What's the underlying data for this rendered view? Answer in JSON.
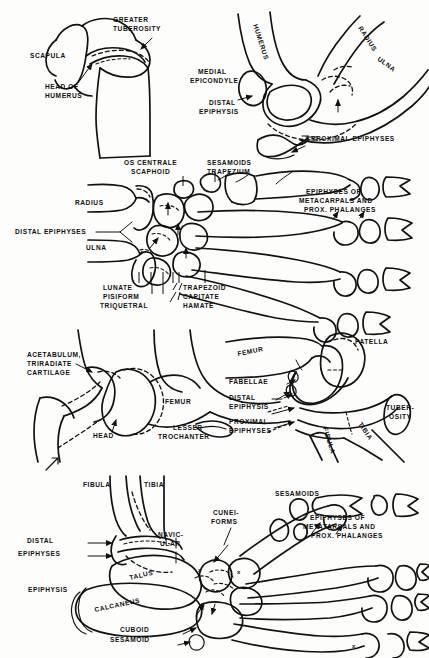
{
  "figure": {
    "page_mark": "71",
    "ink_color": "#111111",
    "background_color": "#fdfdfc",
    "panel_count": 4
  },
  "panels": [
    {
      "id": "shoulder-elbow",
      "name": "Shoulder and elbow",
      "labels": [
        {
          "id": "greater-tuberosity",
          "lines": [
            "GREATER",
            "TUBEROSITY"
          ],
          "x": 113,
          "y": 22,
          "anchor": "start"
        },
        {
          "id": "scapula",
          "lines": [
            "SCAPULA"
          ],
          "x": 30,
          "y": 56,
          "anchor": "start"
        },
        {
          "id": "head-of-humerus",
          "lines": [
            "HEAD OF",
            "HUMERUS"
          ],
          "x": 45,
          "y": 87,
          "anchor": "start"
        },
        {
          "id": "humerus-elbow",
          "lines": [
            "HUMERUS"
          ],
          "x": 253,
          "y": 25,
          "anchor": "start",
          "rotate": 72
        },
        {
          "id": "radius",
          "lines": [
            "RADIUS"
          ],
          "x": 358,
          "y": 28,
          "anchor": "start",
          "rotate": 57
        },
        {
          "id": "ulna",
          "lines": [
            "ULNA"
          ],
          "x": 377,
          "y": 60,
          "anchor": "start",
          "rotate": 36
        },
        {
          "id": "medial-epicondyle",
          "lines": [
            "MEDIAL",
            "EPICONDYLE"
          ],
          "x": 198,
          "y": 72,
          "anchor": "start"
        },
        {
          "id": "distal-epiphysis",
          "lines": [
            "DISTAL",
            "EPIPHYSIS"
          ],
          "x": 206,
          "y": 103,
          "anchor": "start"
        },
        {
          "id": "proximal-epiphyses",
          "lines": [
            "PROXIMAL EPIPHYSES"
          ],
          "x": 311,
          "y": 139,
          "anchor": "start"
        }
      ]
    },
    {
      "id": "hand-wrist",
      "name": "Hand and wrist",
      "labels": [
        {
          "id": "os-centrale",
          "lines": [
            "OS CENTRALE"
          ],
          "x": 124,
          "y": 163,
          "anchor": "start"
        },
        {
          "id": "scaphoid",
          "lines": [
            "SCAPHOID"
          ],
          "x": 131,
          "y": 172,
          "anchor": "start"
        },
        {
          "id": "sesamoids",
          "lines": [
            "SESAMOIDS"
          ],
          "x": 207,
          "y": 163,
          "anchor": "start"
        },
        {
          "id": "trapezium",
          "lines": [
            "TRAPEZIUM"
          ],
          "x": 207,
          "y": 172,
          "anchor": "start"
        },
        {
          "id": "radius-hand",
          "lines": [
            "RADIUS"
          ],
          "x": 75,
          "y": 203,
          "anchor": "start"
        },
        {
          "id": "ulna-hand",
          "lines": [
            "ULNA"
          ],
          "x": 86,
          "y": 248,
          "anchor": "start"
        },
        {
          "id": "distal-epiphyses-hand",
          "lines": [
            "DISTAL EPIPHYSES"
          ],
          "x": 15,
          "y": 230,
          "anchor": "start"
        },
        {
          "id": "epiphyses-metacarpals",
          "lines": [
            "EPIPHYSES OF",
            "METACARPALS AND",
            "PROX. PHALANGES"
          ],
          "x": 303,
          "y": 192,
          "anchor": "start"
        },
        {
          "id": "lunate",
          "lines": [
            "LUNATE"
          ],
          "x": 103,
          "y": 288,
          "anchor": "start"
        },
        {
          "id": "pisiform",
          "lines": [
            "PISIFORM"
          ],
          "x": 103,
          "y": 297,
          "anchor": "start"
        },
        {
          "id": "triquetral",
          "lines": [
            "TRIQUETRAL"
          ],
          "x": 103,
          "y": 306,
          "anchor": "start"
        },
        {
          "id": "trapezoid",
          "lines": [
            "TRAPEZOID"
          ],
          "x": 181,
          "y": 288,
          "anchor": "start"
        },
        {
          "id": "capitate",
          "lines": [
            "CAPITATE"
          ],
          "x": 181,
          "y": 297,
          "anchor": "start"
        },
        {
          "id": "hamate",
          "lines": [
            "HAMATE"
          ],
          "x": 181,
          "y": 306,
          "anchor": "start"
        }
      ]
    },
    {
      "id": "hip-knee",
      "name": "Hip and knee",
      "labels": [
        {
          "id": "acetabulum",
          "lines": [
            "ACETABULUM,",
            "TRIRADIATE",
            "CARTILAGE"
          ],
          "x": 27,
          "y": 355,
          "anchor": "start"
        },
        {
          "id": "femur-hip",
          "lines": [
            "FEMUR"
          ],
          "x": 165,
          "y": 402,
          "anchor": "start"
        },
        {
          "id": "head",
          "lines": [
            "HEAD"
          ],
          "x": 93,
          "y": 436,
          "anchor": "start"
        },
        {
          "id": "lesser-trochanter",
          "lines": [
            "LESSER",
            "TROCHANTER"
          ],
          "x": 160,
          "y": 428,
          "anchor": "start"
        },
        {
          "id": "patella",
          "lines": [
            "PATELLA"
          ],
          "x": 355,
          "y": 342,
          "anchor": "start"
        },
        {
          "id": "femur-knee",
          "lines": [
            "FEMUR"
          ],
          "x": 238,
          "y": 354,
          "anchor": "start",
          "rotate": -12
        },
        {
          "id": "fabellae",
          "lines": [
            "FABELLAE"
          ],
          "x": 229,
          "y": 382,
          "anchor": "start"
        },
        {
          "id": "distal-epiphysis-knee",
          "lines": [
            "DISTAL",
            "EPIPHYSIS"
          ],
          "x": 229,
          "y": 398,
          "anchor": "start"
        },
        {
          "id": "proximal-epiphyses-knee",
          "lines": [
            "PROXIMAL",
            "EPIPHYSES"
          ],
          "x": 229,
          "y": 422,
          "anchor": "start"
        },
        {
          "id": "tuberosity",
          "lines": [
            "TUBER-",
            "OSITY"
          ],
          "x": 385,
          "y": 408,
          "anchor": "start"
        },
        {
          "id": "fibula-knee",
          "lines": [
            "FIBULA"
          ],
          "x": 323,
          "y": 428,
          "anchor": "start",
          "rotate": 73
        },
        {
          "id": "tibia-knee",
          "lines": [
            "TIBIA"
          ],
          "x": 358,
          "y": 424,
          "anchor": "start",
          "rotate": 57
        }
      ]
    },
    {
      "id": "foot-ankle",
      "name": "Foot and ankle",
      "labels": [
        {
          "id": "fibula-foot",
          "lines": [
            "FIBULA"
          ],
          "x": 83,
          "y": 485,
          "anchor": "start"
        },
        {
          "id": "tibia-foot",
          "lines": [
            "TIBIA"
          ],
          "x": 144,
          "y": 485,
          "anchor": "start"
        },
        {
          "id": "sesamoids-foot",
          "lines": [
            "SESAMOIDS"
          ],
          "x": 275,
          "y": 494,
          "anchor": "start"
        },
        {
          "id": "cuneiforms",
          "lines": [
            "CUNEI-",
            "FORMS"
          ],
          "x": 211,
          "y": 513,
          "anchor": "start"
        },
        {
          "id": "navicular",
          "lines": [
            "NAVIC-",
            "ULAR"
          ],
          "x": 154,
          "y": 535,
          "anchor": "start"
        },
        {
          "id": "distal-epiphyses-foot",
          "lines": [
            "DISTAL",
            "EPIPHYSES"
          ],
          "x": 18,
          "y": 541,
          "anchor": "start"
        },
        {
          "id": "epiphyses-metatarsals",
          "lines": [
            "EPIPHYSES OF",
            "METATARSALS AND",
            "PROX. PHALANGES"
          ],
          "x": 305,
          "y": 518,
          "anchor": "start"
        },
        {
          "id": "talus",
          "lines": [
            "TALUS"
          ],
          "x": 123,
          "y": 572,
          "anchor": "start",
          "rotate": -14
        },
        {
          "id": "epiphysis-foot",
          "lines": [
            "EPIPHYSIS"
          ],
          "x": 28,
          "y": 590,
          "anchor": "start"
        },
        {
          "id": "calcaneus",
          "lines": [
            "CALCANEUS"
          ],
          "x": 82,
          "y": 600,
          "anchor": "start",
          "rotate": -12
        },
        {
          "id": "cuboid",
          "lines": [
            "CUBOID"
          ],
          "x": 118,
          "y": 630,
          "anchor": "start"
        },
        {
          "id": "sesamoid-foot",
          "lines": [
            "SESAMOID"
          ],
          "x": 110,
          "y": 640,
          "anchor": "start"
        }
      ]
    }
  ]
}
